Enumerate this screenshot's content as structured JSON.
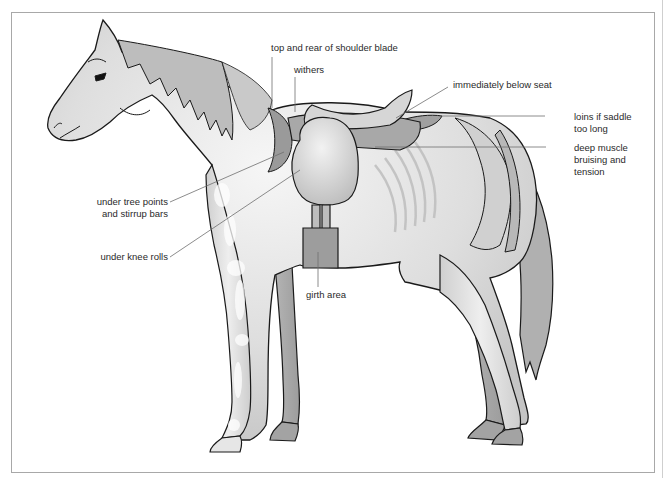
{
  "diagram": {
    "colors": {
      "outline": "#1a1a1a",
      "body_fill": "#dcdcdc",
      "highlight": "#f4f4f4",
      "shade": "#a9a9a9",
      "saddle": "#c4c4c4",
      "leader_line": "#6e6e6e",
      "frame": "#a8a8a8"
    },
    "labels": {
      "shoulder_blade": {
        "lines": [
          "top and rear of shoulder blade"
        ]
      },
      "withers": {
        "lines": [
          "withers"
        ]
      },
      "below_seat": {
        "lines": [
          "immediately below seat"
        ]
      },
      "loins": {
        "lines": [
          "loins if saddle",
          "too long"
        ]
      },
      "deep_muscle": {
        "lines": [
          "deep muscle",
          "bruising and",
          "tension"
        ]
      },
      "tree_points": {
        "lines": [
          "under tree points",
          "and stirrup bars"
        ]
      },
      "knee_rolls": {
        "lines": [
          "under knee rolls"
        ]
      },
      "girth": {
        "lines": [
          "girth area"
        ]
      }
    }
  }
}
